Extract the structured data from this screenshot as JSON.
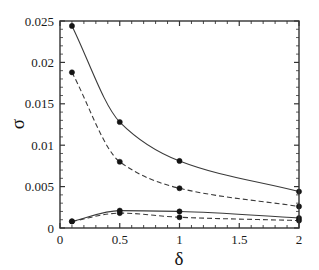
{
  "chart_data": {
    "type": "line",
    "title": "",
    "xlabel": "δ",
    "ylabel": "σ",
    "xlim": [
      0,
      2
    ],
    "ylim": [
      0,
      0.025
    ],
    "grid": false,
    "legend": "none",
    "xticks": [
      0,
      0.5,
      1,
      1.5,
      2
    ],
    "xticklabels": [
      "0",
      "0.5",
      "1",
      "1.5",
      "2"
    ],
    "yticks": [
      0,
      0.005,
      0.01,
      0.015,
      0.02,
      0.025
    ],
    "yticklabels": [
      "0",
      "0.005",
      "0.01",
      "0.015",
      "0.02",
      "0.025"
    ],
    "x": [
      0.1,
      0.5,
      1,
      2
    ],
    "series": [
      {
        "name": "upper-solid",
        "style": "solid",
        "marker": "filled-circle",
        "color": "#3a3a3a",
        "values": [
          0.0244,
          0.0128,
          0.0081,
          0.0044
        ]
      },
      {
        "name": "upper-dashed",
        "style": "dashed",
        "marker": "filled-circle",
        "color": "#3a3a3a",
        "values": [
          0.0188,
          0.008,
          0.0048,
          0.0026
        ]
      },
      {
        "name": "lower-solid",
        "style": "solid",
        "marker": "filled-circle",
        "color": "#3a3a3a",
        "values": [
          0.0008,
          0.0021,
          0.002,
          0.0012
        ]
      },
      {
        "name": "lower-dashed",
        "style": "dashed",
        "marker": "filled-circle",
        "color": "#3a3a3a",
        "values": [
          0.0008,
          0.0018,
          0.0013,
          0.0009
        ]
      }
    ]
  },
  "axis": {
    "x_label": "δ",
    "y_label": "σ",
    "x_tick_labels": [
      "0",
      "0.5",
      "1",
      "1.5",
      "2"
    ],
    "y_tick_labels": [
      "0",
      "0.005",
      "0.01",
      "0.015",
      "0.02",
      "0.025"
    ]
  },
  "style": {
    "frame_color": "#333333",
    "line_color": "#3a3a3a",
    "marker_color": "#141414",
    "background": "#ffffff"
  }
}
